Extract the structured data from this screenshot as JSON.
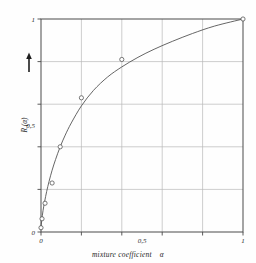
{
  "chart_data": {
    "type": "line",
    "title": "",
    "subtitle": "",
    "xlabel": "mixture coefficient",
    "xlabel_symbol": "α",
    "ylabel": "R (α)",
    "xlim": [
      0,
      1
    ],
    "ylim": [
      0,
      1
    ],
    "grid": true,
    "grid_color": "#b9b9b9",
    "frame_color": "#4a4a4a",
    "curve_color": "#555555",
    "marker_color": "#555555",
    "marker_style": "open-circle",
    "legend": null,
    "legend_position": "none",
    "x_ticks": [
      0,
      0.2,
      0.4,
      0.6,
      0.8,
      1
    ],
    "y_ticks": [
      0,
      0.2,
      0.4,
      0.6,
      0.8,
      1
    ],
    "x_tick_labels": [
      "0",
      "",
      "",
      "0,5",
      "",
      "1"
    ],
    "y_tick_labels": [
      "0",
      "",
      "0,5",
      "",
      "1"
    ],
    "x_labeled_ticks": [
      {
        "value": 0,
        "label": "0"
      },
      {
        "value": 0.5,
        "label": "0,5"
      },
      {
        "value": 1,
        "label": "1"
      }
    ],
    "y_labeled_ticks": [
      {
        "value": 0,
        "label": "0"
      },
      {
        "value": 0.5,
        "label": "0,5"
      },
      {
        "value": 1,
        "label": "1"
      }
    ],
    "y_axis_arrow": "up-arrow",
    "series": [
      {
        "name": "R(α)",
        "x": [
          0.0,
          0.005,
          0.02,
          0.055,
          0.095,
          0.2,
          0.4,
          1.0
        ],
        "values": [
          0.02,
          0.062,
          0.135,
          0.23,
          0.4,
          0.63,
          0.81,
          1.0
        ]
      }
    ],
    "curve_x": [
      0.0,
      0.004,
      0.01,
      0.018,
      0.028,
      0.04,
      0.055,
      0.072,
      0.095,
      0.12,
      0.15,
      0.2,
      0.26,
      0.33,
      0.4,
      0.48,
      0.56,
      0.65,
      0.75,
      0.86,
      1.0
    ],
    "curve_y": [
      0.02,
      0.058,
      0.1,
      0.143,
      0.19,
      0.238,
      0.29,
      0.34,
      0.4,
      0.455,
      0.512,
      0.592,
      0.665,
      0.728,
      0.775,
      0.82,
      0.858,
      0.895,
      0.932,
      0.967,
      1.0
    ]
  }
}
